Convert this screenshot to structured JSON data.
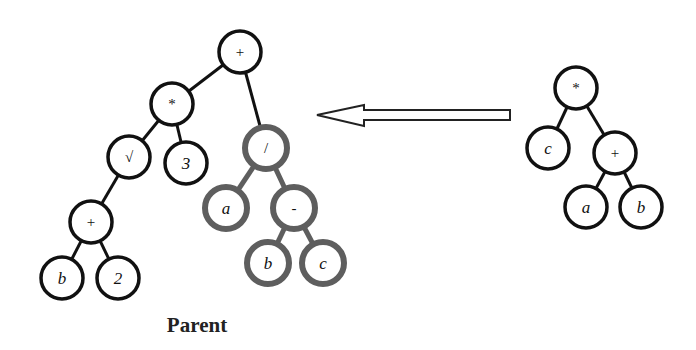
{
  "caption": "Parent",
  "colors": {
    "default_node": "#111111",
    "highlighted_subtree": "#5e5e5e"
  },
  "parent_tree": {
    "nodes": [
      {
        "id": "p_root",
        "label": "+",
        "x": 240,
        "y": 52,
        "style": "black",
        "kind": "op"
      },
      {
        "id": "p_mul",
        "label": "*",
        "x": 172,
        "y": 104,
        "style": "black",
        "kind": "op"
      },
      {
        "id": "p_sqrt",
        "label": "√",
        "x": 129,
        "y": 157,
        "style": "black",
        "kind": "op"
      },
      {
        "id": "p_3",
        "label": "3",
        "x": 186,
        "y": 163,
        "style": "black",
        "kind": "leaf"
      },
      {
        "id": "p_plus2",
        "label": "+",
        "x": 91,
        "y": 222,
        "style": "black",
        "kind": "op"
      },
      {
        "id": "p_b1",
        "label": "b",
        "x": 62,
        "y": 278,
        "style": "black",
        "kind": "leaf"
      },
      {
        "id": "p_2",
        "label": "2",
        "x": 118,
        "y": 278,
        "style": "black",
        "kind": "leaf"
      },
      {
        "id": "p_div",
        "label": "/",
        "x": 266,
        "y": 148,
        "style": "gray",
        "kind": "op"
      },
      {
        "id": "p_a",
        "label": "a",
        "x": 226,
        "y": 208,
        "style": "gray",
        "kind": "leaf"
      },
      {
        "id": "p_minus",
        "label": "-",
        "x": 294,
        "y": 208,
        "style": "gray",
        "kind": "op"
      },
      {
        "id": "p_b2",
        "label": "b",
        "x": 268,
        "y": 263,
        "style": "gray",
        "kind": "leaf"
      },
      {
        "id": "p_c",
        "label": "c",
        "x": 323,
        "y": 263,
        "style": "gray",
        "kind": "leaf"
      }
    ],
    "edges": [
      {
        "from": "p_root",
        "to": "p_mul",
        "style": "black"
      },
      {
        "from": "p_root",
        "to": "p_div",
        "style": "black"
      },
      {
        "from": "p_mul",
        "to": "p_sqrt",
        "style": "black"
      },
      {
        "from": "p_mul",
        "to": "p_3",
        "style": "black"
      },
      {
        "from": "p_sqrt",
        "to": "p_plus2",
        "style": "black"
      },
      {
        "from": "p_plus2",
        "to": "p_b1",
        "style": "black"
      },
      {
        "from": "p_plus2",
        "to": "p_2",
        "style": "black"
      },
      {
        "from": "p_div",
        "to": "p_a",
        "style": "gray"
      },
      {
        "from": "p_div",
        "to": "p_minus",
        "style": "gray"
      },
      {
        "from": "p_minus",
        "to": "p_b2",
        "style": "gray"
      },
      {
        "from": "p_minus",
        "to": "p_c",
        "style": "gray"
      }
    ]
  },
  "donor_tree": {
    "nodes": [
      {
        "id": "d_mul",
        "label": "*",
        "x": 576,
        "y": 88,
        "style": "black",
        "kind": "op"
      },
      {
        "id": "d_c",
        "label": "c",
        "x": 548,
        "y": 148,
        "style": "black",
        "kind": "leaf"
      },
      {
        "id": "d_plus",
        "label": "+",
        "x": 615,
        "y": 153,
        "style": "black",
        "kind": "op"
      },
      {
        "id": "d_a",
        "label": "a",
        "x": 586,
        "y": 207,
        "style": "black",
        "kind": "leaf"
      },
      {
        "id": "d_b",
        "label": "b",
        "x": 641,
        "y": 207,
        "style": "black",
        "kind": "leaf"
      }
    ],
    "edges": [
      {
        "from": "d_mul",
        "to": "d_c",
        "style": "black"
      },
      {
        "from": "d_mul",
        "to": "d_plus",
        "style": "black"
      },
      {
        "from": "d_plus",
        "to": "d_a",
        "style": "black"
      },
      {
        "from": "d_plus",
        "to": "d_b",
        "style": "black"
      }
    ]
  },
  "arrow": {
    "direction": "left",
    "tip_x": 317,
    "head_base_x": 364,
    "tail_x": 510,
    "center_y": 115
  },
  "node_radius": 21
}
